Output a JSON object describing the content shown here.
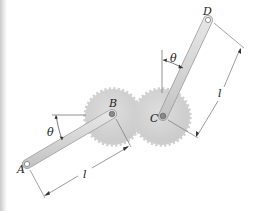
{
  "figure": {
    "type": "mechanism diagram",
    "labels": {
      "A": "A",
      "B": "B",
      "C": "C",
      "D": "D",
      "theta_left": "θ",
      "theta_right": "θ",
      "length_left": "l",
      "length_right": "l"
    },
    "components": {
      "gears": [
        {
          "name": "gear-B",
          "center": [
            113,
            117
          ],
          "radius": 27,
          "teeth": 32
        },
        {
          "name": "gear-C",
          "center": [
            162,
            117
          ],
          "radius": 27,
          "teeth": 32
        }
      ],
      "bars": [
        {
          "name": "bar-AB",
          "from": "A",
          "to": "B"
        },
        {
          "name": "bar-CD",
          "from": "C",
          "to": "D"
        }
      ]
    },
    "colors": {
      "gear_fill": "#d4d4d4",
      "bar_fill": "#d9d9d9",
      "line": "#555555"
    }
  }
}
